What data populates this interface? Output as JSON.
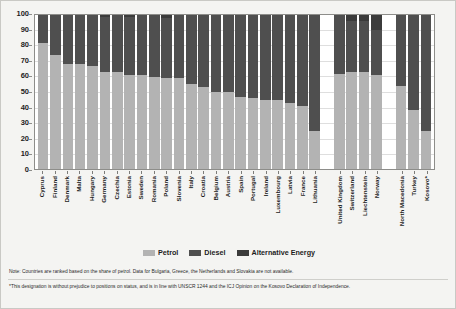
{
  "chart_data": {
    "type": "bar",
    "subtype": "stacked-100-percent",
    "title": "",
    "xlabel": "",
    "ylabel": "",
    "ylim": [
      0,
      100
    ],
    "yticks": [
      0,
      10,
      20,
      30,
      40,
      50,
      60,
      70,
      80,
      90,
      100
    ],
    "grid": true,
    "legend_position": "bottom-center",
    "categories": [
      "Cyprus",
      "Finland",
      "Denmark",
      "Malta",
      "Hungary",
      "Germany",
      "Czechia",
      "Estonia",
      "Sweden",
      "Romania",
      "Poland",
      "Slovenia",
      "Italy",
      "Croatia",
      "Belgium",
      "Austria",
      "Spain",
      "Portugal",
      "Ireland",
      "Luxembourg",
      "Latvia",
      "France",
      "Lithuania",
      "United Kingdom",
      "Switzerland",
      "Liechtenstein",
      "Norway",
      "North Macedonia",
      "Turkey",
      "Kosovo*"
    ],
    "group_breaks_after": [
      "Lithuania",
      "Norway"
    ],
    "series": [
      {
        "name": "Petrol",
        "color": "#b3b3b3",
        "values": [
          82,
          74,
          68,
          68,
          67,
          63,
          63,
          61,
          61,
          60,
          59,
          59,
          55,
          53,
          50,
          50,
          47,
          46,
          45,
          45,
          43,
          41,
          25,
          62,
          63,
          63,
          61,
          54,
          38,
          25
        ]
      },
      {
        "name": "Diesel",
        "color": "#4f4f4f",
        "values": [
          18,
          26,
          32,
          32,
          33,
          36,
          37,
          38,
          39,
          40,
          39,
          41,
          45,
          47,
          50,
          50,
          53,
          54,
          55,
          55,
          57,
          59,
          75,
          38,
          33,
          33,
          29,
          46,
          62,
          75
        ]
      },
      {
        "name": "Alternative Energy",
        "color": "#3b3b3b",
        "values": [
          0,
          0,
          0,
          0,
          0,
          1,
          0,
          1,
          0,
          0,
          2,
          0,
          0,
          0,
          0,
          0,
          0,
          0,
          0,
          0,
          0,
          0,
          0,
          0,
          4,
          4,
          10,
          0,
          0,
          0
        ]
      }
    ]
  },
  "legend": {
    "items": [
      {
        "label": "Petrol",
        "color": "#b3b3b3"
      },
      {
        "label": "Diesel",
        "color": "#4f4f4f"
      },
      {
        "label": "Alternative Energy",
        "color": "#3b3b3b"
      }
    ]
  },
  "notes": {
    "note_1": "Note: Countries are ranked based on the share of petrol. Data for Bulgaria, Greece, the Netherlands and Slovakia are not available.",
    "note_2": "*This designation is without prejudice to positions on status, and is in line with UNSCR 1244 and the ICJ Opinion on the Kosovo Declaration of Independence."
  }
}
